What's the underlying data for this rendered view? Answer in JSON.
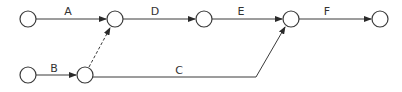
{
  "diagram": {
    "type": "activity-on-arrow network",
    "nodes": [
      {
        "id": "n1",
        "x": 28,
        "y": 19
      },
      {
        "id": "n2",
        "x": 115,
        "y": 19
      },
      {
        "id": "n3",
        "x": 204,
        "y": 19
      },
      {
        "id": "n4",
        "x": 291,
        "y": 19
      },
      {
        "id": "n5",
        "x": 380,
        "y": 19
      },
      {
        "id": "n6",
        "x": 28,
        "y": 75
      },
      {
        "id": "n7",
        "x": 85,
        "y": 75
      }
    ],
    "edges": [
      {
        "label": "A",
        "from": "n1",
        "to": "n2",
        "style": "solid"
      },
      {
        "label": "D",
        "from": "n2",
        "to": "n3",
        "style": "solid"
      },
      {
        "label": "E",
        "from": "n3",
        "to": "n4",
        "style": "solid"
      },
      {
        "label": "F",
        "from": "n4",
        "to": "n5",
        "style": "solid"
      },
      {
        "label": "B",
        "from": "n6",
        "to": "n7",
        "style": "solid"
      },
      {
        "label": "C",
        "from": "n7",
        "to": "n4",
        "style": "solid"
      },
      {
        "label": "",
        "from": "n7",
        "to": "n2",
        "style": "dashed",
        "note": "dummy activity"
      }
    ],
    "labels": {
      "A": "A",
      "B": "B",
      "C": "C",
      "D": "D",
      "E": "E",
      "F": "F"
    },
    "colors": {
      "stroke": "#3a3a3a",
      "text": "#333333",
      "background": "#ffffff"
    }
  }
}
